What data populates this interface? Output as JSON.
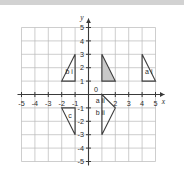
{
  "figure": {
    "title": "",
    "axis_labels": {
      "x": "x",
      "y": "y"
    },
    "origin_label": "0",
    "x_ticks": [
      "-5",
      "-4",
      "-3",
      "-2",
      "-1",
      "2",
      "3",
      "4",
      "5"
    ],
    "y_ticks": [
      "5",
      "4",
      "3",
      "2",
      "1",
      "-1",
      "-2",
      "-3",
      "-4",
      "-5"
    ],
    "colors": {
      "grid": "#b9b9b9",
      "axis": "#3a3a3a",
      "shape_stroke": "#3f3f3f",
      "shape_fill": "#c9c9c9",
      "text": "#2b2b2b",
      "topbar": "#d2d2d2"
    }
  },
  "chart_data": {
    "type": "scatter",
    "title": "",
    "xlabel": "x",
    "ylabel": "y",
    "xlim": [
      -5.5,
      5.5
    ],
    "ylim": [
      -5.5,
      5.5
    ],
    "grid": true,
    "legend": "none",
    "x_ticks": [
      -5,
      -4,
      -3,
      -2,
      -1,
      0,
      2,
      3,
      4,
      5
    ],
    "y_ticks": [
      5,
      4,
      3,
      2,
      1,
      0,
      -1,
      -2,
      -3,
      -4,
      -5
    ],
    "shapes": [
      {
        "name": "b i",
        "label": "b i",
        "label_at": [
          -1.72,
          1.55
        ],
        "filled": false,
        "points": [
          [
            -2,
            1
          ],
          [
            -1,
            1
          ],
          [
            -1,
            3
          ]
        ]
      },
      {
        "name": "shaded",
        "label": "",
        "label_at": null,
        "filled": true,
        "points": [
          [
            1,
            3
          ],
          [
            1,
            1
          ],
          [
            2,
            1
          ]
        ]
      },
      {
        "name": "a i",
        "label": "a i",
        "label_at": [
          4.22,
          1.55
        ],
        "filled": false,
        "points": [
          [
            4,
            3
          ],
          [
            4,
            1
          ],
          [
            5,
            1
          ]
        ]
      },
      {
        "name": "c",
        "label": "c",
        "label_at": [
          -1.52,
          -1.75
        ],
        "filled": false,
        "points": [
          [
            -2,
            -1
          ],
          [
            -1,
            -1
          ],
          [
            -1,
            -3
          ]
        ]
      },
      {
        "name": "a ii / b ii",
        "label": "",
        "label_at": null,
        "filled": false,
        "points": [
          [
            1,
            0
          ],
          [
            1,
            -3
          ],
          [
            2,
            -1
          ]
        ]
      }
    ],
    "annotations": [
      {
        "text": "a ii",
        "x": 0.55,
        "y": -0.65
      },
      {
        "text": "b ii",
        "x": 0.55,
        "y": -1.55
      }
    ]
  }
}
